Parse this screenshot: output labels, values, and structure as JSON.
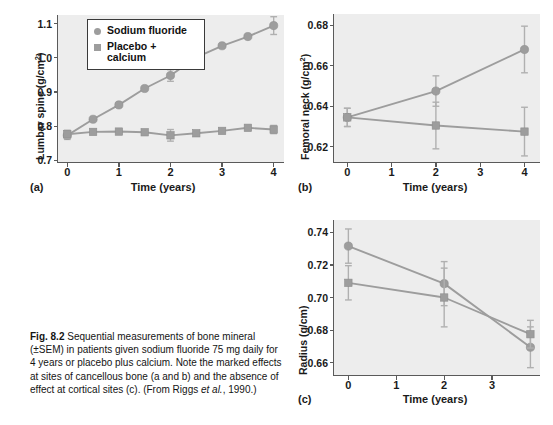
{
  "figure": {
    "caption_label": "Fig. 8.2",
    "caption_text": "Sequential measurements of bone mineral (±SEM) in patients given sodium fluoride 75 mg daily for 4 years or placebo plus calcium. Note the marked effects at sites of cancellous bone (a and b) and the absence of effect at cortical sites (c). (From Riggs ",
    "caption_italic": "et al.",
    "caption_tail": ", 1990.)"
  },
  "legend": {
    "series": [
      {
        "label": "Sodium fluoride",
        "marker": "circle",
        "color": "#9d9d9d"
      },
      {
        "label": "Placebo +\ncalcium",
        "marker": "square",
        "color": "#9d9d9d"
      }
    ]
  },
  "colors": {
    "marker": "#9d9d9d",
    "line": "#9d9d9d",
    "error_bar": "#b0b0b0",
    "plot_background": "#ededed",
    "axis": "#5a5a5a",
    "text": "#1a1a1a"
  },
  "chart_data": [
    {
      "type": "line",
      "panel": "a",
      "title": "",
      "xlabel": "Time (years)",
      "ylabel": "Lumbar spine (g/cm2)",
      "ylabel_unit_sup": "2",
      "xlim": [
        -0.18,
        4.2
      ],
      "ylim": [
        0.695,
        1.125
      ],
      "xticks": [
        0,
        1,
        2,
        3,
        4
      ],
      "xticklabels": [
        "0",
        "1",
        "2",
        "3",
        "4"
      ],
      "yticks": [
        0.7,
        0.8,
        0.9,
        1.0,
        1.1
      ],
      "yticklabels": [
        "0.7",
        "0.8",
        "0.9",
        "1.0",
        "1.1"
      ],
      "grid": false,
      "legend_position": "upper-left-inside",
      "series": [
        {
          "name": "Sodium fluoride",
          "marker": "circle",
          "x": [
            0,
            0.5,
            1,
            1.5,
            2,
            2.5,
            3,
            3.5,
            4
          ],
          "values": [
            0.773,
            0.82,
            0.862,
            0.91,
            0.948,
            1.001,
            1.035,
            1.062,
            1.094
          ],
          "errors": [
            0.012,
            null,
            null,
            null,
            0.017,
            null,
            null,
            null,
            0.026
          ]
        },
        {
          "name": "Placebo + calcium",
          "marker": "square",
          "x": [
            0,
            0.5,
            1,
            1.5,
            2,
            2.5,
            3,
            3.5,
            4
          ],
          "values": [
            0.776,
            0.783,
            0.784,
            0.782,
            0.773,
            0.779,
            0.786,
            0.795,
            0.79
          ],
          "errors": [
            0.012,
            null,
            null,
            null,
            0.017,
            null,
            null,
            null,
            0.012
          ]
        }
      ]
    },
    {
      "type": "line",
      "panel": "b",
      "title": "",
      "xlabel": "Time (years)",
      "ylabel": "Femoral neck (g/cm2)",
      "ylabel_unit_sup": "2",
      "xlim": [
        -0.3,
        4.35
      ],
      "ylim": [
        0.6125,
        0.6855
      ],
      "xticks": [
        0,
        1,
        2,
        3,
        4
      ],
      "xticklabels": [
        "0",
        "1",
        "2",
        "3",
        "4"
      ],
      "yticks": [
        0.62,
        0.64,
        0.66,
        0.68
      ],
      "yticklabels": [
        "0.62",
        "0.64",
        "0.66",
        "0.68"
      ],
      "grid": false,
      "legend_position": "none",
      "series": [
        {
          "name": "Sodium fluoride",
          "marker": "circle",
          "x": [
            0,
            2,
            4
          ],
          "values": [
            0.6345,
            0.6475,
            0.668
          ],
          "errors": [
            0.0045,
            0.0075,
            0.0115
          ]
        },
        {
          "name": "Placebo + calcium",
          "marker": "square",
          "x": [
            0,
            2,
            4
          ],
          "values": [
            0.6345,
            0.6305,
            0.6275
          ],
          "errors": [
            0.0045,
            0.0115,
            0.012
          ]
        }
      ]
    },
    {
      "type": "line",
      "panel": "c",
      "title": "",
      "xlabel": "Time (years)",
      "ylabel": "Radius (g/cm)",
      "ylabel_unit_sup": "",
      "xlim": [
        -0.3,
        4.0
      ],
      "ylim": [
        0.6525,
        0.7475
      ],
      "xticks": [
        0,
        1,
        2,
        3
      ],
      "xticklabels": [
        "0",
        "1",
        "2",
        "3"
      ],
      "yticks": [
        0.66,
        0.68,
        0.7,
        0.72,
        0.74
      ],
      "yticklabels": [
        "0.66",
        "0.68",
        "0.70",
        "0.72",
        "0.74"
      ],
      "grid": false,
      "legend_position": "none",
      "series": [
        {
          "name": "Sodium fluoride",
          "marker": "circle",
          "x": [
            0,
            2,
            3.8
          ],
          "values": [
            0.7315,
            0.7085,
            0.6695
          ],
          "errors": [
            0.0105,
            0.0135,
            0.0125
          ]
        },
        {
          "name": "Placebo + calcium",
          "marker": "square",
          "x": [
            0,
            2,
            3.8
          ],
          "values": [
            0.709,
            0.7,
            0.6775
          ],
          "errors": [
            0.0105,
            0.018,
            0.0085
          ]
        }
      ]
    }
  ],
  "panels": {
    "a": {
      "tag": "(a)"
    },
    "b": {
      "tag": "(b)"
    },
    "c": {
      "tag": "(c)"
    }
  }
}
